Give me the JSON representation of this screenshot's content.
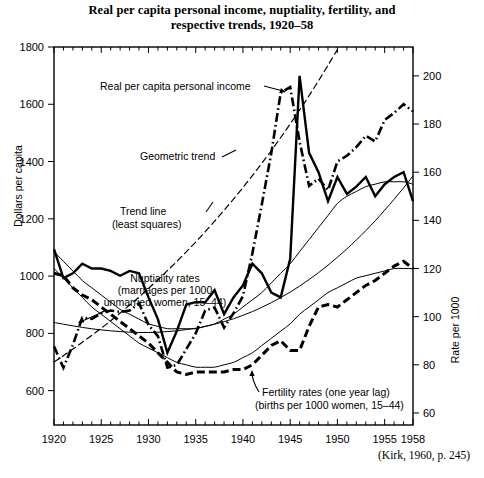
{
  "title": {
    "line1": "Real per capita personal income, nuptiality, fertility, and",
    "line2": "respective trends, 1920–58"
  },
  "source_note": "(Kirk, 1960, p. 245)",
  "axes": {
    "left_title": "Dollars per capita",
    "right_title": "Rate per 1000",
    "left_ticks": [
      "1800",
      "1600",
      "1400",
      "1200",
      "1000",
      "800",
      "600"
    ],
    "right_ticks": [
      "200",
      "180",
      "160",
      "140",
      "120",
      "100",
      "80",
      "60"
    ],
    "x_ticks": [
      "1920",
      "1925",
      "1930",
      "1935",
      "1940",
      "1945",
      "1950",
      "1955",
      "1958"
    ]
  },
  "annotations": {
    "income": "Real per capita personal income",
    "geometric_trend": "Geometric trend",
    "trend_line_1": "Trend line",
    "trend_line_2": "(least squares)",
    "nuptiality_1": "Nuptiality rates",
    "nuptiality_2": "(marriages per 1000",
    "nuptiality_3": "unmarried women, 15–44)",
    "fertility_1": "Fertility rates (one year lag)",
    "fertility_2": "(births per 1000 women, 15–44)"
  },
  "colors": {
    "ink": "#000000",
    "background": "#ffffff",
    "trend_thin": "#1a1a1a"
  },
  "chart_data": {
    "type": "line",
    "title": "Real per capita personal income, nuptiality, fertility, and respective trends, 1920–58",
    "xlabel": "",
    "ylabel": "Dollars per capita",
    "y2label": "Rate per 1000",
    "xlim": [
      1920,
      1958
    ],
    "ylim": [
      480,
      1800
    ],
    "y2lim": [
      55,
      212
    ],
    "grid": false,
    "legend": "annotations-inline",
    "x": [
      1920,
      1921,
      1922,
      1923,
      1924,
      1925,
      1926,
      1927,
      1928,
      1929,
      1930,
      1931,
      1932,
      1933,
      1934,
      1935,
      1936,
      1937,
      1938,
      1939,
      1940,
      1941,
      1942,
      1943,
      1944,
      1945,
      1946,
      1947,
      1948,
      1949,
      1950,
      1951,
      1952,
      1953,
      1954,
      1955,
      1956,
      1957,
      1958
    ],
    "series": [
      {
        "name": "Real per capita personal income",
        "axis": "left",
        "units": "dollars per capita",
        "style": "dash-dot",
        "values": [
          755,
          680,
          760,
          855,
          850,
          870,
          880,
          875,
          880,
          905,
          830,
          790,
          680,
          690,
          745,
          800,
          880,
          890,
          820,
          870,
          930,
          1080,
          1250,
          1430,
          1640,
          1660,
          1470,
          1315,
          1340,
          1300,
          1400,
          1420,
          1450,
          1490,
          1470,
          1545,
          1570,
          1600,
          1575
        ]
      },
      {
        "name": "Geometric trend",
        "axis": "left",
        "units": "dollars per capita",
        "style": "dashed",
        "values": [
          700,
          722,
          745,
          769,
          793,
          818,
          844,
          871,
          899,
          927,
          957,
          987,
          1019,
          1051,
          1085,
          1119,
          1155,
          1192,
          1230,
          1269,
          1309,
          1351,
          1394,
          1438,
          1484,
          1531,
          1580,
          1630,
          1682,
          1736,
          1791,
          1791,
          1791,
          1791,
          1791,
          1791,
          1791,
          1791,
          1791
        ],
        "note": "exponential trend drawn 1920 to about 1950"
      },
      {
        "name": "Trend line (least squares)",
        "axis": "left",
        "units": "dollars per capita",
        "style": "thin-solid",
        "values": [
          838,
          832,
          826,
          821,
          816,
          812,
          809,
          806,
          804,
          803,
          803,
          804,
          806,
          809,
          813,
          818,
          824,
          832,
          841,
          851,
          863,
          876,
          891,
          907,
          925,
          944,
          965,
          988,
          1012,
          1038,
          1066,
          1095,
          1126,
          1159,
          1193,
          1230,
          1268,
          1308,
          1350
        ],
        "note": "shallow quadratic curve, low near 1930"
      },
      {
        "name": "Nuptiality rates (marriages per 1000 unmarried women, 15–44)",
        "axis": "right",
        "units": "rate per 1000",
        "style": "solid",
        "values": [
          128,
          116,
          118,
          122,
          120,
          120,
          119,
          117,
          119,
          118,
          108,
          99,
          85,
          94,
          105,
          106,
          106,
          111,
          101,
          108,
          113,
          122,
          118,
          110,
          108,
          124,
          200,
          168,
          160,
          148,
          158,
          151,
          154,
          158,
          150,
          155,
          158,
          160,
          148
        ]
      },
      {
        "name": "Nuptiality trend",
        "axis": "right",
        "units": "rate per 1000",
        "style": "thin-solid",
        "values": [
          127,
          123,
          119,
          115,
          112,
          109,
          106,
          103,
          101,
          99,
          97,
          96,
          95,
          95,
          95,
          95,
          96,
          97,
          99,
          101,
          104,
          107,
          110,
          114,
          118,
          122,
          127,
          132,
          137,
          142,
          147,
          150,
          152,
          154,
          155,
          156,
          156,
          156,
          155
        ]
      },
      {
        "name": "Fertility rates (one year lag) (births per 1000 women, 15–44)",
        "axis": "right",
        "units": "rate per 1000",
        "style": "dashed-heavy",
        "values": [
          118,
          117,
          112,
          109,
          107,
          104,
          101,
          98,
          95,
          92,
          89,
          85,
          81,
          77,
          76,
          77,
          77,
          77,
          77,
          78,
          78,
          80,
          84,
          88,
          90,
          86,
          86,
          96,
          104,
          105,
          104,
          107,
          110,
          113,
          115,
          118,
          121,
          123,
          120
        ]
      },
      {
        "name": "Fertility trend",
        "axis": "right",
        "units": "rate per 1000",
        "style": "thin-solid",
        "values": [
          120,
          116,
          112,
          108,
          104,
          101,
          98,
          95,
          92,
          89,
          87,
          85,
          83,
          81,
          80,
          79,
          79,
          79,
          80,
          81,
          83,
          85,
          88,
          91,
          94,
          97,
          101,
          104,
          107,
          110,
          112,
          114,
          116,
          117,
          118,
          119,
          120,
          120,
          120
        ]
      }
    ]
  }
}
